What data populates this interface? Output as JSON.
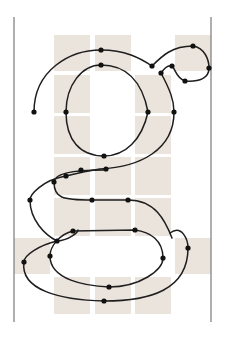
{
  "diagram": {
    "colors": {
      "background": "#ffffff",
      "grid_cell": "#ebe4dd",
      "guide_line": "#7a7a7a",
      "outline": "#1e1e1e",
      "anchor_point": "#111111"
    },
    "guides": [
      {
        "name": "left-guide",
        "x": 14,
        "y1": 17,
        "y2": 322
      },
      {
        "name": "right-guide",
        "x": 211,
        "y1": 17,
        "y2": 322
      }
    ],
    "grid_cells": [
      {
        "x": 54,
        "y": 35,
        "w": 36,
        "h": 36
      },
      {
        "x": 95,
        "y": 35,
        "w": 36,
        "h": 36
      },
      {
        "x": 175,
        "y": 35,
        "w": 36,
        "h": 36
      },
      {
        "x": 54,
        "y": 75,
        "w": 36,
        "h": 38
      },
      {
        "x": 135,
        "y": 75,
        "w": 36,
        "h": 38
      },
      {
        "x": 54,
        "y": 116,
        "w": 36,
        "h": 38
      },
      {
        "x": 135,
        "y": 116,
        "w": 36,
        "h": 38
      },
      {
        "x": 54,
        "y": 157,
        "w": 36,
        "h": 38
      },
      {
        "x": 95,
        "y": 157,
        "w": 36,
        "h": 38
      },
      {
        "x": 135,
        "y": 157,
        "w": 36,
        "h": 38
      },
      {
        "x": 54,
        "y": 198,
        "w": 36,
        "h": 38
      },
      {
        "x": 95,
        "y": 198,
        "w": 36,
        "h": 38
      },
      {
        "x": 135,
        "y": 198,
        "w": 36,
        "h": 38
      },
      {
        "x": 14,
        "y": 238,
        "w": 36,
        "h": 36
      },
      {
        "x": 175,
        "y": 238,
        "w": 36,
        "h": 36
      },
      {
        "x": 54,
        "y": 277,
        "w": 36,
        "h": 37
      },
      {
        "x": 95,
        "y": 277,
        "w": 36,
        "h": 37
      },
      {
        "x": 135,
        "y": 277,
        "w": 36,
        "h": 37
      }
    ],
    "paths": [
      {
        "name": "bowl-outer-and-ear",
        "d": "M 34 112 C 34 70 70 50 101 50 C 125 50 140 58 152 66 C 162 56 172 46 193 46 C 205 48 209 60 209 68 C 209 78 200 82 185 81 C 176 78 176 70 172 66 C 167 64 163 70 161 73"
      },
      {
        "name": "bowl-inner",
        "d": "M 66 112 C 66 85 82 65 101 65 C 125 65 142 80 148 112"
      },
      {
        "name": "ear-inner",
        "d": "M 161 73 C 170 90 174 100 174 112"
      },
      {
        "name": "bowl-right-down",
        "d": "M 174 112 C 174 150 140 167 100 169 C 86 171 74 174 66 176"
      },
      {
        "name": "bowl-inner-bottom",
        "d": "M 66 112 C 66 140 80 156 104 156 C 125 156 142 140 148 112"
      },
      {
        "name": "link-left",
        "d": "M 66 176 C 42 180 30 195 30 200 C 30 220 45 235 57 241"
      },
      {
        "name": "link-inner",
        "d": "M 104 170 C 80 170 54 172 54 182 C 54 198 62 200 92 200 L 128 200 C 155 200 165 220 172 238"
      },
      {
        "name": "loop-outer",
        "d": "M 57 241 C 40 245 24 255 24 262 C 20 290 60 300 104 301 C 150 301 188 290 188 248 C 188 240 182 224 170 233"
      },
      {
        "name": "loop-outer-link",
        "d": "M 57 241 C 70 240 78 232 78 230"
      },
      {
        "name": "loop-inner",
        "d": "M 73 231 C 60 234 50 246 50 256 C 50 280 86 286 109 287 C 140 287 163 270 163 258 C 163 240 150 232 135 230 L 73 231"
      }
    ],
    "anchor_points": [
      {
        "x": 34,
        "y": 112
      },
      {
        "x": 66,
        "y": 112
      },
      {
        "x": 101,
        "y": 50
      },
      {
        "x": 101,
        "y": 65
      },
      {
        "x": 152,
        "y": 66
      },
      {
        "x": 193,
        "y": 46
      },
      {
        "x": 209,
        "y": 68
      },
      {
        "x": 185,
        "y": 81
      },
      {
        "x": 172,
        "y": 66
      },
      {
        "x": 161,
        "y": 73
      },
      {
        "x": 148,
        "y": 112
      },
      {
        "x": 174,
        "y": 112
      },
      {
        "x": 104,
        "y": 156
      },
      {
        "x": 66,
        "y": 176
      },
      {
        "x": 81,
        "y": 170
      },
      {
        "x": 106,
        "y": 169
      },
      {
        "x": 54,
        "y": 182
      },
      {
        "x": 30,
        "y": 200
      },
      {
        "x": 92,
        "y": 200
      },
      {
        "x": 128,
        "y": 200
      },
      {
        "x": 57,
        "y": 241
      },
      {
        "x": 73,
        "y": 231
      },
      {
        "x": 135,
        "y": 230
      },
      {
        "x": 24,
        "y": 262
      },
      {
        "x": 50,
        "y": 256
      },
      {
        "x": 163,
        "y": 258
      },
      {
        "x": 188,
        "y": 248
      },
      {
        "x": 109,
        "y": 287
      },
      {
        "x": 104,
        "y": 301
      }
    ]
  }
}
